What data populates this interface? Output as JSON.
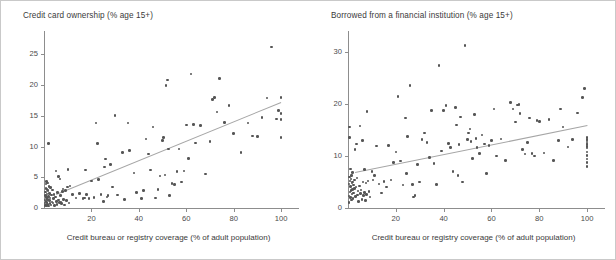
{
  "figure": {
    "background": "#ffffff",
    "dot_color": "#555555",
    "axis_color": "#8d8d8d",
    "trend_color": "#a6a6a6"
  },
  "chart_data": [
    {
      "id": "credit-card-ownership",
      "type": "scatter",
      "title": "Credit card ownership (% age 15+)",
      "xlabel": "Credit bureau or registry coverage (% of adult population)",
      "ylabel": "",
      "xlim": [
        0,
        105
      ],
      "ylim": [
        0,
        27.5
      ],
      "xticks": [
        20,
        40,
        60,
        80,
        100
      ],
      "yticks": [
        0,
        5,
        10,
        15,
        20,
        25
      ],
      "grid": false,
      "legend": null,
      "trendline": {
        "x0": 5,
        "y0": 2.2,
        "x1": 100,
        "y1": 17.2
      },
      "points": [
        [
          0.4,
          0.3
        ],
        [
          0.5,
          0.8
        ],
        [
          0.5,
          1.3
        ],
        [
          0.6,
          2.0
        ],
        [
          0.6,
          0.5
        ],
        [
          0.7,
          2.6
        ],
        [
          0.8,
          3.2
        ],
        [
          0.8,
          1.1
        ],
        [
          0.9,
          3.9
        ],
        [
          1.0,
          4.3
        ],
        [
          1.0,
          0.4
        ],
        [
          1.1,
          1.7
        ],
        [
          1.2,
          2.3
        ],
        [
          1.2,
          0.9
        ],
        [
          1.3,
          3.0
        ],
        [
          1.4,
          1.4
        ],
        [
          1.5,
          4.1
        ],
        [
          1.6,
          0.6
        ],
        [
          1.7,
          2.8
        ],
        [
          1.8,
          1.9
        ],
        [
          1.9,
          0.3
        ],
        [
          2.0,
          10.5
        ],
        [
          2.1,
          3.5
        ],
        [
          2.2,
          1.2
        ],
        [
          2.3,
          2.4
        ],
        [
          2.5,
          0.7
        ],
        [
          2.6,
          1.6
        ],
        [
          2.8,
          3.3
        ],
        [
          3.0,
          0.5
        ],
        [
          3.1,
          2.1
        ],
        [
          3.3,
          1.0
        ],
        [
          3.5,
          2.9
        ],
        [
          3.8,
          0.8
        ],
        [
          4.0,
          1.5
        ],
        [
          4.2,
          2.2
        ],
        [
          4.5,
          0.4
        ],
        [
          4.8,
          1.8
        ],
        [
          5.0,
          6.0
        ],
        [
          5.2,
          1.1
        ],
        [
          5.5,
          0.6
        ],
        [
          5.8,
          2.5
        ],
        [
          6.0,
          5.1
        ],
        [
          6.2,
          1.3
        ],
        [
          6.5,
          0.9
        ],
        [
          6.8,
          4.7
        ],
        [
          7.0,
          2.0
        ],
        [
          7.2,
          1.0
        ],
        [
          7.5,
          0.7
        ],
        [
          7.8,
          2.7
        ],
        [
          8.0,
          3.1
        ],
        [
          8.3,
          1.4
        ],
        [
          8.6,
          0.5
        ],
        [
          9.0,
          2.8
        ],
        [
          9.4,
          1.2
        ],
        [
          9.8,
          3.4
        ],
        [
          10.2,
          6.3
        ],
        [
          10.5,
          0.8
        ],
        [
          11.0,
          3.6
        ],
        [
          12.0,
          2.2
        ],
        [
          13.5,
          1.6
        ],
        [
          15.0,
          2.4
        ],
        [
          16.5,
          1.5
        ],
        [
          17.0,
          1.6
        ],
        [
          17.5,
          6.2
        ],
        [
          18.0,
          2.2
        ],
        [
          19.0,
          1.5
        ],
        [
          20.0,
          4.4
        ],
        [
          21.0,
          1.7
        ],
        [
          22.0,
          13.8
        ],
        [
          22.5,
          10.5
        ],
        [
          23.0,
          4.6
        ],
        [
          24.0,
          2.2
        ],
        [
          25.0,
          1.1
        ],
        [
          25.5,
          6.7
        ],
        [
          26.0,
          8.0
        ],
        [
          26.5,
          1.8
        ],
        [
          27.0,
          2.0
        ],
        [
          28.0,
          7.1
        ],
        [
          29.0,
          3.4
        ],
        [
          30.0,
          15.1
        ],
        [
          31.0,
          2.1
        ],
        [
          33.0,
          9.0
        ],
        [
          34.0,
          1.4
        ],
        [
          35.5,
          13.8
        ],
        [
          36.0,
          9.4
        ],
        [
          38.0,
          5.7
        ],
        [
          39.0,
          2.5
        ],
        [
          41.0,
          1.5
        ],
        [
          42.0,
          2.8
        ],
        [
          43.0,
          11.2
        ],
        [
          44.0,
          8.8
        ],
        [
          45.0,
          6.2
        ],
        [
          46.0,
          13.2
        ],
        [
          47.0,
          1.6
        ],
        [
          48.0,
          3.0
        ],
        [
          49.0,
          5.2
        ],
        [
          50.0,
          11.0
        ],
        [
          50.5,
          11.5
        ],
        [
          51.0,
          5.4
        ],
        [
          51.5,
          19.9
        ],
        [
          52.0,
          20.8
        ],
        [
          52.5,
          9.6
        ],
        [
          53.0,
          2.0
        ],
        [
          54.0,
          4.0
        ],
        [
          55.0,
          3.8
        ],
        [
          56.0,
          5.9
        ],
        [
          57.0,
          9.6
        ],
        [
          58.0,
          4.2
        ],
        [
          59.0,
          6.0
        ],
        [
          60.0,
          13.5
        ],
        [
          61.0,
          8.1
        ],
        [
          62.0,
          21.8
        ],
        [
          63.0,
          13.6
        ],
        [
          64.0,
          10.6
        ],
        [
          66.0,
          13.4
        ],
        [
          68.0,
          5.5
        ],
        [
          70.0,
          10.8
        ],
        [
          71.0,
          17.7
        ],
        [
          72.0,
          18.0
        ],
        [
          73.0,
          15.6
        ],
        [
          74.0,
          21.1
        ],
        [
          76.0,
          13.9
        ],
        [
          78.0,
          16.7
        ],
        [
          80.0,
          12.1
        ],
        [
          83.0,
          9.0
        ],
        [
          86.0,
          13.8
        ],
        [
          88.0,
          11.7
        ],
        [
          90.0,
          11.6
        ],
        [
          92.0,
          14.7
        ],
        [
          94.0,
          17.9
        ],
        [
          96.0,
          26.2
        ],
        [
          98.0,
          14.5
        ],
        [
          99.0,
          15.9
        ],
        [
          100.0,
          15.4
        ],
        [
          100.0,
          11.5
        ],
        [
          100.0,
          18.0
        ],
        [
          100.0,
          14.4
        ]
      ]
    },
    {
      "id": "borrowed-from-financial-institution",
      "type": "scatter",
      "title": "Borrowed from a financial institution (% age 15+)",
      "xlabel": "Credit bureau or registry coverage (% of adult population)",
      "ylabel": "",
      "xlim": [
        0,
        105
      ],
      "ylim": [
        0,
        32.5
      ],
      "xticks": [
        20,
        40,
        60,
        80,
        100
      ],
      "yticks": [
        0,
        10,
        20,
        30
      ],
      "grid": false,
      "legend": null,
      "trendline": {
        "x0": 3,
        "y0": 7.0,
        "x1": 100,
        "y1": 16.0
      },
      "points": [
        [
          0.4,
          1.1
        ],
        [
          0.5,
          2.3
        ],
        [
          0.5,
          4.6
        ],
        [
          0.6,
          6.0
        ],
        [
          0.6,
          13.6
        ],
        [
          0.7,
          15.6
        ],
        [
          0.8,
          3.1
        ],
        [
          0.9,
          5.2
        ],
        [
          1.0,
          7.5
        ],
        [
          1.0,
          2.0
        ],
        [
          1.1,
          4.1
        ],
        [
          1.2,
          5.6
        ],
        [
          1.3,
          3.4
        ],
        [
          1.4,
          6.3
        ],
        [
          1.5,
          1.5
        ],
        [
          1.6,
          4.8
        ],
        [
          1.7,
          2.7
        ],
        [
          1.8,
          5.0
        ],
        [
          1.9,
          3.6
        ],
        [
          2.0,
          6.8
        ],
        [
          2.1,
          1.8
        ],
        [
          2.2,
          4.4
        ],
        [
          2.4,
          2.9
        ],
        [
          2.6,
          5.4
        ],
        [
          2.8,
          3.8
        ],
        [
          3.0,
          11.2
        ],
        [
          3.2,
          2.2
        ],
        [
          3.4,
          4.0
        ],
        [
          3.6,
          12.3
        ],
        [
          3.8,
          5.8
        ],
        [
          4.0,
          2.5
        ],
        [
          4.2,
          3.3
        ],
        [
          4.5,
          1.3
        ],
        [
          4.8,
          4.2
        ],
        [
          5.0,
          15.8
        ],
        [
          5.2,
          2.8
        ],
        [
          5.5,
          3.5
        ],
        [
          5.8,
          1.6
        ],
        [
          6.0,
          13.0
        ],
        [
          6.2,
          5.0
        ],
        [
          6.5,
          2.4
        ],
        [
          6.8,
          3.0
        ],
        [
          7.0,
          7.4
        ],
        [
          7.2,
          1.4
        ],
        [
          7.5,
          4.8
        ],
        [
          7.8,
          2.6
        ],
        [
          8.0,
          18.6
        ],
        [
          8.4,
          5.2
        ],
        [
          8.8,
          3.2
        ],
        [
          9.2,
          2.1
        ],
        [
          10.0,
          7.0
        ],
        [
          10.5,
          5.4
        ],
        [
          11.0,
          6.2
        ],
        [
          12.0,
          11.9
        ],
        [
          13.0,
          4.6
        ],
        [
          14.0,
          2.9
        ],
        [
          15.0,
          5.1
        ],
        [
          16.0,
          4.0
        ],
        [
          17.0,
          12.0
        ],
        [
          18.0,
          5.4
        ],
        [
          19.0,
          8.8
        ],
        [
          20.0,
          10.8
        ],
        [
          21.0,
          21.4
        ],
        [
          22.0,
          9.0
        ],
        [
          23.0,
          4.4
        ],
        [
          24.0,
          17.3
        ],
        [
          24.5,
          6.6
        ],
        [
          25.0,
          13.7
        ],
        [
          26.0,
          23.6
        ],
        [
          27.0,
          4.5
        ],
        [
          27.5,
          2.1
        ],
        [
          28.0,
          2.4
        ],
        [
          29.0,
          8.4
        ],
        [
          30.0,
          5.0
        ],
        [
          31.0,
          13.2
        ],
        [
          32.0,
          14.4
        ],
        [
          33.0,
          12.6
        ],
        [
          34.0,
          9.7
        ],
        [
          35.0,
          18.8
        ],
        [
          36.0,
          8.6
        ],
        [
          37.0,
          4.5
        ],
        [
          38.0,
          27.4
        ],
        [
          39.0,
          11.0
        ],
        [
          40.0,
          18.7
        ],
        [
          41.0,
          19.7
        ],
        [
          42.0,
          12.4
        ],
        [
          43.0,
          11.6
        ],
        [
          44.0,
          7.0
        ],
        [
          45.0,
          19.3
        ],
        [
          45.5,
          16.0
        ],
        [
          46.0,
          6.3
        ],
        [
          46.5,
          12.2
        ],
        [
          47.0,
          17.5
        ],
        [
          48.0,
          5.0
        ],
        [
          49.0,
          31.2
        ],
        [
          50.0,
          13.2
        ],
        [
          50.5,
          14.4
        ],
        [
          51.0,
          15.2
        ],
        [
          51.5,
          12.8
        ],
        [
          52.0,
          9.5
        ],
        [
          53.0,
          18.0
        ],
        [
          53.5,
          13.4
        ],
        [
          54.0,
          11.6
        ],
        [
          55.0,
          10.5
        ],
        [
          56.0,
          14.0
        ],
        [
          57.0,
          12.3
        ],
        [
          58.0,
          6.6
        ],
        [
          59.0,
          12.0
        ],
        [
          60.0,
          13.0
        ],
        [
          61.0,
          19.0
        ],
        [
          62.0,
          10.0
        ],
        [
          64.0,
          13.3
        ],
        [
          66.0,
          9.1
        ],
        [
          68.0,
          20.3
        ],
        [
          69.0,
          19.0
        ],
        [
          70.0,
          16.5
        ],
        [
          71.0,
          19.8
        ],
        [
          71.5,
          19.9
        ],
        [
          72.0,
          18.2
        ],
        [
          73.0,
          11.2
        ],
        [
          74.0,
          10.4
        ],
        [
          75.0,
          12.6
        ],
        [
          76.0,
          17.3
        ],
        [
          77.0,
          10.5
        ],
        [
          78.0,
          10.0
        ],
        [
          79.0,
          16.8
        ],
        [
          80.0,
          16.6
        ],
        [
          82.0,
          10.6
        ],
        [
          84.0,
          17.0
        ],
        [
          86.0,
          9.1
        ],
        [
          88.0,
          13.0
        ],
        [
          89.0,
          19.0
        ],
        [
          90.0,
          15.6
        ],
        [
          92.0,
          11.7
        ],
        [
          94.0,
          13.2
        ],
        [
          96.0,
          18.3
        ],
        [
          98.0,
          21.2
        ],
        [
          99.0,
          23.0
        ],
        [
          100.0,
          13.6
        ],
        [
          100.0,
          12.9
        ],
        [
          100.0,
          12.2
        ],
        [
          100.0,
          11.5
        ],
        [
          100.0,
          10.8
        ],
        [
          100.0,
          10.1
        ],
        [
          100.0,
          9.4
        ],
        [
          100.0,
          8.7
        ],
        [
          100.0,
          8.0
        ],
        [
          100.0,
          13.2
        ],
        [
          100.0,
          12.5
        ],
        [
          100.0,
          11.8
        ]
      ]
    }
  ]
}
